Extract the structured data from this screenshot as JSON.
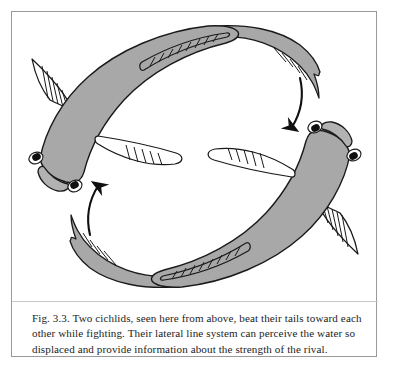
{
  "figure": {
    "label": "Fig. 3.3.",
    "caption_lines": [
      "Fig. 3.3. Two cichlids, seen here from above, beat their tails toward each",
      "other while fighting. Their lateral line system can perceive the water so",
      "displaced and provide information about the strength of the rival."
    ],
    "caption_full": "Fig. 3.3. Two cichlids, seen here from above, beat their tails toward each other while fighting. Their lateral line system can perceive the water so displaced and provide information about the strength of the rival."
  },
  "colors": {
    "page_background": "#ffffff",
    "frame_border": "#9a9a9a",
    "body_fill": "#a8a8a8",
    "body_outline": "#1a1a1a",
    "fin_fill": "#ffffff",
    "fin_outline": "#1a1a1a",
    "eye_fill": "#111111",
    "arrow_stroke": "#101010",
    "caption_text": "#1d1d1d",
    "rule": "#c8c8c8"
  },
  "illustration": {
    "title": "Two cichlids beating tails toward each other",
    "view": "from above",
    "subjects": [
      {
        "name": "cichlid-upper-left",
        "orientation": "head at lower-left, body arcs up and right, tail sweeps to upper-right",
        "parts": [
          "head",
          "left-eye",
          "right-eye",
          "body",
          "dorsal-fin",
          "pectoral-fin-upper",
          "pectoral-fin-lower",
          "caudal-tail"
        ]
      },
      {
        "name": "cichlid-lower-right",
        "orientation": "head at upper-right, body arcs down and left, tail sweeps to lower-left",
        "parts": [
          "head",
          "left-eye",
          "right-eye",
          "body",
          "dorsal-fin",
          "pectoral-fin-upper",
          "pectoral-fin-lower",
          "caudal-tail"
        ]
      }
    ],
    "motion_arrows": [
      {
        "name": "arrow-left-upward",
        "direction": "up",
        "meaning": "tail beat circulation"
      },
      {
        "name": "arrow-right-downward",
        "direction": "down",
        "meaning": "tail beat circulation"
      }
    ]
  }
}
